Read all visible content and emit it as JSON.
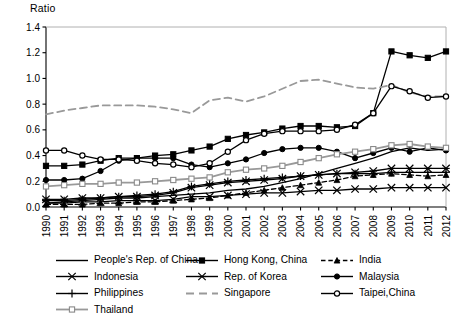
{
  "axis": {
    "y_title": "Ratio",
    "y_ticks": [
      "0.0",
      "0.2",
      "0.4",
      "0.6",
      "0.8",
      "1.0",
      "1.2",
      "1.4"
    ],
    "x_ticks": [
      "1990",
      "1991",
      "1992",
      "1993",
      "1994",
      "1995",
      "1996",
      "1997",
      "1998",
      "1999",
      "2000",
      "2001",
      "2002",
      "2003",
      "2004",
      "2005",
      "2006",
      "2007",
      "2008",
      "2009",
      "2010",
      "2011",
      "2012"
    ]
  },
  "legend": {
    "rows": [
      [
        {
          "label": "People's Rep. of China",
          "style": "solid-plain",
          "color": "#000000"
        },
        {
          "label": "Hong Kong, China",
          "style": "solid-square-filled",
          "color": "#000000"
        },
        {
          "label": "India",
          "style": "dashed-triangle",
          "color": "#000000"
        }
      ],
      [
        {
          "label": "Indonesia",
          "style": "solid-x",
          "color": "#000000"
        },
        {
          "label": "Rep. of Korea",
          "style": "solid-starx",
          "color": "#000000"
        },
        {
          "label": "Malaysia",
          "style": "solid-circle-filled",
          "color": "#000000"
        }
      ],
      [
        {
          "label": "Philippines",
          "style": "solid-plus",
          "color": "#000000"
        },
        {
          "label": "Singapore",
          "style": "dashed-gray",
          "color": "#999999"
        },
        {
          "label": "Taipei,China",
          "style": "solid-circle-open",
          "color": "#000000"
        }
      ],
      [
        {
          "label": "Thailand",
          "style": "solid-square-gray",
          "color": "#999999"
        }
      ]
    ]
  },
  "chart_data": {
    "type": "line",
    "title": "",
    "xlabel": "",
    "ylabel": "Ratio",
    "ylim": [
      0.0,
      1.4
    ],
    "grid": false,
    "legend_position": "bottom",
    "x": [
      "1990",
      "1991",
      "1992",
      "1993",
      "1994",
      "1995",
      "1996",
      "1997",
      "1998",
      "1999",
      "2000",
      "2001",
      "2002",
      "2003",
      "2004",
      "2005",
      "2006",
      "2007",
      "2008",
      "2009",
      "2010",
      "2011",
      "2012"
    ],
    "series": [
      {
        "name": "People's Rep. of China",
        "marker": "none",
        "dash": "solid",
        "color": "#000000",
        "values": [
          0.03,
          0.04,
          0.05,
          0.06,
          0.07,
          0.07,
          0.08,
          0.09,
          0.1,
          0.11,
          0.13,
          0.14,
          0.16,
          0.19,
          0.22,
          0.26,
          0.3,
          0.34,
          0.38,
          0.43,
          0.46,
          0.44,
          0.45
        ]
      },
      {
        "name": "Hong Kong, China",
        "marker": "square-filled",
        "dash": "solid",
        "color": "#000000",
        "values": [
          0.32,
          0.32,
          0.33,
          0.36,
          0.38,
          0.38,
          0.4,
          0.41,
          0.44,
          0.47,
          0.53,
          0.56,
          0.58,
          0.61,
          0.63,
          0.63,
          0.62,
          0.63,
          0.73,
          1.21,
          1.18,
          1.16,
          1.21
        ]
      },
      {
        "name": "India",
        "marker": "triangle",
        "dash": "dashed",
        "color": "#000000",
        "values": [
          0.02,
          0.02,
          0.02,
          0.03,
          0.03,
          0.04,
          0.04,
          0.05,
          0.06,
          0.07,
          0.09,
          0.11,
          0.13,
          0.15,
          0.17,
          0.19,
          0.21,
          0.24,
          0.25,
          0.26,
          0.25,
          0.24,
          0.25
        ]
      },
      {
        "name": "Indonesia",
        "marker": "x",
        "dash": "solid",
        "color": "#000000",
        "values": [
          0.03,
          0.03,
          0.04,
          0.04,
          0.05,
          0.05,
          0.05,
          0.06,
          0.08,
          0.08,
          0.09,
          0.1,
          0.11,
          0.11,
          0.12,
          0.13,
          0.13,
          0.14,
          0.14,
          0.15,
          0.15,
          0.15,
          0.15
        ]
      },
      {
        "name": "Rep. of Korea",
        "marker": "starx",
        "dash": "solid",
        "color": "#000000",
        "values": [
          0.06,
          0.06,
          0.07,
          0.07,
          0.08,
          0.08,
          0.09,
          0.11,
          0.15,
          0.17,
          0.19,
          0.2,
          0.21,
          0.22,
          0.24,
          0.25,
          0.26,
          0.27,
          0.28,
          0.3,
          0.3,
          0.3,
          0.3
        ]
      },
      {
        "name": "Malaysia",
        "marker": "circle-filled",
        "dash": "solid",
        "color": "#000000",
        "values": [
          0.21,
          0.21,
          0.22,
          0.28,
          0.36,
          0.38,
          0.38,
          0.38,
          0.33,
          0.31,
          0.34,
          0.37,
          0.42,
          0.45,
          0.46,
          0.46,
          0.43,
          0.38,
          0.42,
          0.46,
          0.43,
          0.46,
          0.44
        ]
      },
      {
        "name": "Philippines",
        "marker": "plus",
        "dash": "solid",
        "color": "#000000",
        "values": [
          0.05,
          0.05,
          0.06,
          0.07,
          0.08,
          0.09,
          0.1,
          0.12,
          0.16,
          0.18,
          0.2,
          0.21,
          0.22,
          0.23,
          0.24,
          0.25,
          0.26,
          0.26,
          0.26,
          0.27,
          0.27,
          0.27,
          0.27
        ]
      },
      {
        "name": "Singapore",
        "marker": "none",
        "dash": "dashed",
        "color": "#999999",
        "values": [
          0.72,
          0.75,
          0.77,
          0.79,
          0.79,
          0.79,
          0.78,
          0.76,
          0.73,
          0.83,
          0.85,
          0.82,
          0.86,
          0.92,
          0.98,
          0.99,
          0.96,
          0.93,
          0.92,
          0.95,
          0.89,
          0.86,
          0.86
        ]
      },
      {
        "name": "Taipei,China",
        "marker": "circle-open",
        "dash": "solid",
        "color": "#000000",
        "values": [
          0.44,
          0.44,
          0.4,
          0.37,
          0.37,
          0.36,
          0.34,
          0.33,
          0.31,
          0.34,
          0.43,
          0.52,
          0.57,
          0.59,
          0.59,
          0.59,
          0.6,
          0.64,
          0.73,
          0.94,
          0.9,
          0.85,
          0.86
        ]
      },
      {
        "name": "Thailand",
        "marker": "square-gray",
        "dash": "solid",
        "color": "#999999",
        "values": [
          0.16,
          0.17,
          0.18,
          0.18,
          0.19,
          0.19,
          0.2,
          0.21,
          0.22,
          0.23,
          0.27,
          0.29,
          0.3,
          0.32,
          0.35,
          0.38,
          0.41,
          0.43,
          0.45,
          0.48,
          0.49,
          0.47,
          0.46
        ]
      }
    ]
  }
}
